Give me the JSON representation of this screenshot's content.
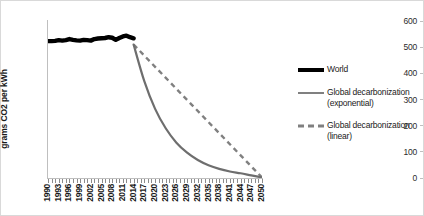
{
  "chart_data": {
    "type": "line",
    "title": "",
    "xlabel": "",
    "ylabel": "grams CO2 per kWh",
    "ylim": [
      0,
      600
    ],
    "yticks": [
      0,
      100,
      200,
      300,
      400,
      500,
      600
    ],
    "xlim": [
      1990,
      2050
    ],
    "tick_labels": [
      "1990",
      "1993",
      "1996",
      "1999",
      "2002",
      "2005",
      "2008",
      "2011",
      "2014",
      "2017",
      "2020",
      "2023",
      "2026",
      "2029",
      "2032",
      "2035",
      "2038",
      "2041",
      "2044",
      "2047",
      "2050"
    ],
    "grid": false,
    "legend_position": "right",
    "series": [
      {
        "name": "World",
        "style": "solid-thick-black",
        "color": "#000000",
        "x": [
          1990,
          1991,
          1992,
          1993,
          1994,
          1995,
          1996,
          1997,
          1998,
          1999,
          2000,
          2001,
          2002,
          2003,
          2004,
          2005,
          2006,
          2007,
          2008,
          2009,
          2010,
          2011,
          2012,
          2013,
          2014
        ],
        "values": [
          523,
          523,
          524,
          527,
          525,
          527,
          531,
          528,
          526,
          525,
          528,
          527,
          525,
          531,
          533,
          534,
          535,
          538,
          536,
          528,
          535,
          541,
          544,
          538,
          534
        ]
      },
      {
        "name": "Global decarbonization (exponential)",
        "style": "solid-gray",
        "color": "#808080",
        "x": [
          2014,
          2017,
          2020,
          2023,
          2026,
          2029,
          2032,
          2035,
          2038,
          2041,
          2044,
          2047,
          2050
        ],
        "values": [
          510,
          370,
          265,
          190,
          135,
          97,
          69,
          49,
          35,
          25,
          18,
          10,
          2
        ]
      },
      {
        "name": "Global decarbonization (linear)",
        "style": "dashed-gray",
        "color": "#808080",
        "x": [
          2014,
          2050
        ],
        "values": [
          510,
          2
        ]
      }
    ]
  },
  "legend": {
    "entries": [
      {
        "label": "World",
        "sub": ""
      },
      {
        "label": "Global decarbonization",
        "sub": "(exponential)"
      },
      {
        "label": "Global decarbonization",
        "sub": "(linear)"
      }
    ]
  }
}
